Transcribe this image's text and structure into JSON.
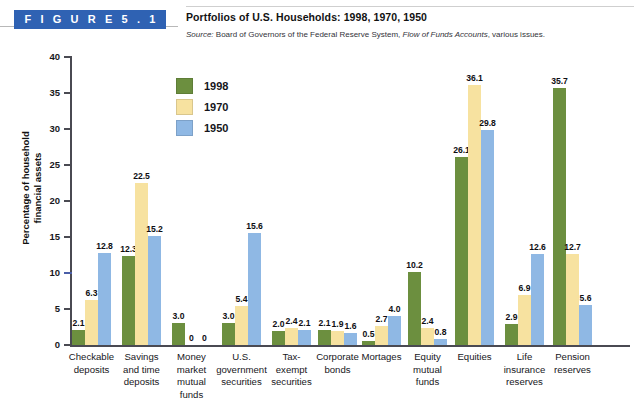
{
  "header": {
    "figure_badge": "F I G U R E   5 . 1",
    "title": "Portfolios of U.S. Households: 1998, 1970, 1950",
    "source_label": "Source:",
    "source_text_before": " Board of Governors of the Federal Reserve System, ",
    "source_italic": "Flow of Funds Accounts",
    "source_text_after": ", various issues."
  },
  "legend": {
    "items": [
      {
        "label": "1998",
        "color": "#6c8f3f"
      },
      {
        "label": "1970",
        "color": "#f7e2a0"
      },
      {
        "label": "1950",
        "color": "#8fb8e4"
      }
    ]
  },
  "axis": {
    "y_title_line1": "Percentage of household",
    "y_title_line2": "financial assets",
    "y_ticks": [
      "0",
      "5",
      "10",
      "15",
      "20",
      "25",
      "30",
      "35",
      "40"
    ]
  },
  "chart_data": {
    "type": "bar",
    "title": "Portfolios of U.S. Households: 1998, 1970, 1950",
    "xlabel": "",
    "ylabel": "Percentage of household financial assets",
    "ylim": [
      0,
      40
    ],
    "ytick_interval": 5,
    "grid": false,
    "legend_position": "upper-left-inside",
    "categories": [
      "Checkable deposits",
      "Savings and time deposits",
      "Money market mutual funds",
      "U.S. government securities",
      "Tax-exempt securities",
      "Corporate bonds",
      "Mortages",
      "Equity mutual funds",
      "Equities",
      "Life insurance reserves",
      "Pension reserves"
    ],
    "category_lines": [
      [
        "Checkable",
        "deposits"
      ],
      [
        "Savings",
        "and time",
        "deposits"
      ],
      [
        "Money",
        "market",
        "mutual",
        "funds"
      ],
      [
        "U.S.",
        "government",
        "securities"
      ],
      [
        "Tax-",
        "exempt",
        "securities"
      ],
      [
        "Corporate",
        "bonds"
      ],
      [
        "Mortages"
      ],
      [
        "Equity",
        "mutual",
        "funds"
      ],
      [
        "Equities"
      ],
      [
        "Life",
        "insurance",
        "reserves"
      ],
      [
        "Pension",
        "reserves"
      ]
    ],
    "series": [
      {
        "name": "1998",
        "color": "#6c8f3f",
        "values": [
          2.1,
          12.3,
          3.0,
          3.0,
          2.0,
          2.1,
          0.5,
          10.2,
          26.1,
          2.9,
          35.7
        ],
        "labels": [
          "2.1",
          "12.3",
          "3.0",
          "3.0",
          "2.0",
          "2.1",
          "0.5",
          "10.2",
          "26.1",
          "2.9",
          "35.7"
        ]
      },
      {
        "name": "1970",
        "color": "#f7e2a0",
        "values": [
          6.3,
          22.5,
          0,
          5.4,
          2.4,
          1.9,
          2.7,
          2.4,
          36.1,
          6.9,
          12.7
        ],
        "labels": [
          "6.3",
          "22.5",
          "0",
          "5.4",
          "2.4",
          "1.9",
          "2.7",
          "2.4",
          "36.1",
          "6.9",
          "12.7"
        ]
      },
      {
        "name": "1950",
        "color": "#8fb8e4",
        "values": [
          12.8,
          15.2,
          0,
          15.6,
          2.1,
          1.6,
          4.0,
          0.8,
          29.8,
          12.6,
          5.6
        ],
        "labels": [
          "12.8",
          "15.2",
          "0",
          "15.6",
          "2.1",
          "1.6",
          "4.0",
          "0.8",
          "29.8",
          "12.6",
          "5.6"
        ]
      }
    ]
  }
}
